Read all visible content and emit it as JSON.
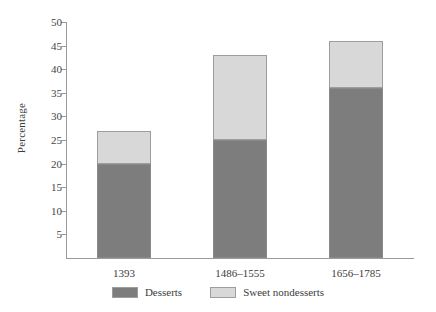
{
  "chart_data": {
    "type": "bar",
    "subtype": "stacked",
    "title": "",
    "xlabel": "",
    "ylabel": "Percentage",
    "ylim": [
      0,
      50
    ],
    "ytick_step": 5,
    "yticks": [
      5,
      10,
      15,
      20,
      25,
      30,
      35,
      40,
      45,
      50
    ],
    "ytick_labels": [
      "5",
      "10",
      "15",
      "20",
      "25",
      "30",
      "35",
      "40",
      "45",
      "50"
    ],
    "grid": false,
    "legend_position": "bottom-center",
    "categories": [
      "1393",
      "1486–1555",
      "1656–1785"
    ],
    "series": [
      {
        "name": "Desserts",
        "color": "#7d7d7d",
        "values": [
          20,
          25,
          36
        ]
      },
      {
        "name": "Sweet nondesserts",
        "color": "#d8d8d8",
        "values": [
          7,
          18,
          10
        ]
      }
    ],
    "totals": [
      27,
      43,
      46
    ]
  },
  "axis": {
    "y_title": "Percentage"
  },
  "colors": {
    "desserts": "#7d7d7d",
    "sweet_nondesserts": "#d8d8d8",
    "axis": "#9a9a9a",
    "bar_outline": "#9d9d9d",
    "text": "#3c3c3c",
    "background": "#ffffff"
  },
  "legend": {
    "items": [
      {
        "label": "Desserts",
        "color": "#7d7d7d"
      },
      {
        "label": "Sweet nondesserts",
        "color": "#d8d8d8"
      }
    ]
  }
}
